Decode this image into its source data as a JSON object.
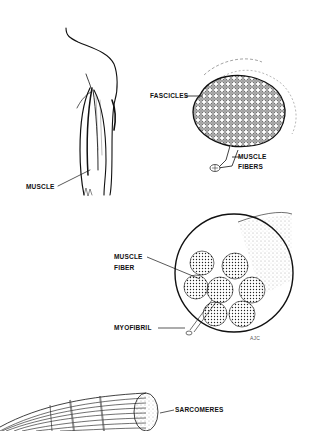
{
  "diagram": {
    "panels": [
      {
        "id": "muscle",
        "label": "MUSCLE"
      },
      {
        "id": "fascicle-cross-section",
        "labels": [
          "FASCICLES",
          "MUSCLE",
          "FIBERS"
        ]
      },
      {
        "id": "fiber-magnified",
        "labels": [
          "MUSCLE",
          "FIBER",
          "MYOFIBRIL"
        ],
        "signature": "AJC"
      },
      {
        "id": "myofibril",
        "label": "SARCOMERES"
      }
    ]
  },
  "labels": {
    "muscle": "MUSCLE",
    "fascicles": "FASCICLES",
    "muscle_fibers_line1": "MUSCLE",
    "muscle_fibers_line2": "FIBERS",
    "muscle_fiber_line1": "MUSCLE",
    "muscle_fiber_line2": "FIBER",
    "myofibril": "MYOFIBRIL",
    "sarcomeres": "SARCOMERES",
    "signature": "AJC"
  },
  "colors": {
    "ink": "#111111",
    "background": "#ffffff"
  }
}
